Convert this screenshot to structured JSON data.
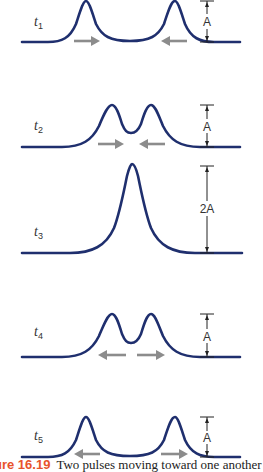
{
  "figure": {
    "caption_number": "ure 16.19",
    "caption_text": "Two pulses moving toward one another",
    "colors": {
      "wave": "#1f2f6e",
      "arrow": "#8c8c8c",
      "caption_number": "#e8532b"
    },
    "panels": [
      {
        "time_label": "t",
        "time_sub": "1",
        "amplitude_label": "A",
        "peaks": "two separated",
        "arrows": "toward each other"
      },
      {
        "time_label": "t",
        "time_sub": "2",
        "amplitude_label": "A",
        "peaks": "two overlapping",
        "arrows": "toward each other"
      },
      {
        "time_label": "t",
        "time_sub": "3",
        "amplitude_label": "2A",
        "peaks": "single combined",
        "arrows": "none"
      },
      {
        "time_label": "t",
        "time_sub": "4",
        "amplitude_label": "A",
        "peaks": "two overlapping",
        "arrows": "away from each other"
      },
      {
        "time_label": "t",
        "time_sub": "5",
        "amplitude_label": "A",
        "peaks": "two separated",
        "arrows": "away from each other"
      }
    ]
  }
}
